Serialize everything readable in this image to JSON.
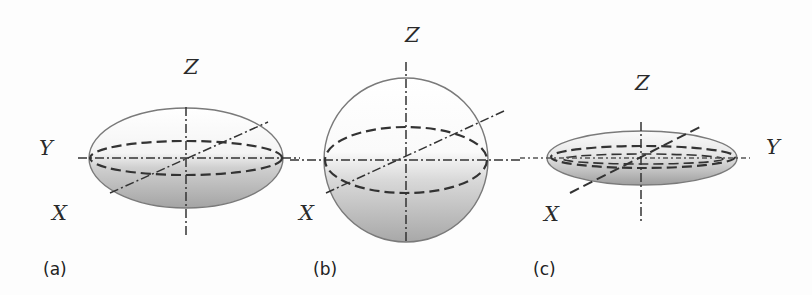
{
  "figure": {
    "colors": {
      "background": "#fdfdfd",
      "shape_top": "#ffffff",
      "shape_bottom": "#a9a9a9",
      "line": "#333333"
    },
    "panels": [
      {
        "id": "a",
        "label": "(a)",
        "shape": "prolate ellipsoid (elongated along Y)",
        "axes": {
          "x": "X",
          "y": "Y",
          "z": "Z"
        }
      },
      {
        "id": "b",
        "label": "(b)",
        "shape": "sphere",
        "axes": {
          "x": "X",
          "z": "Z"
        }
      },
      {
        "id": "c",
        "label": "(c)",
        "shape": "flattened elongated ellipsoid",
        "axes": {
          "x": "X",
          "y": "Y",
          "z": "Z"
        }
      }
    ]
  }
}
